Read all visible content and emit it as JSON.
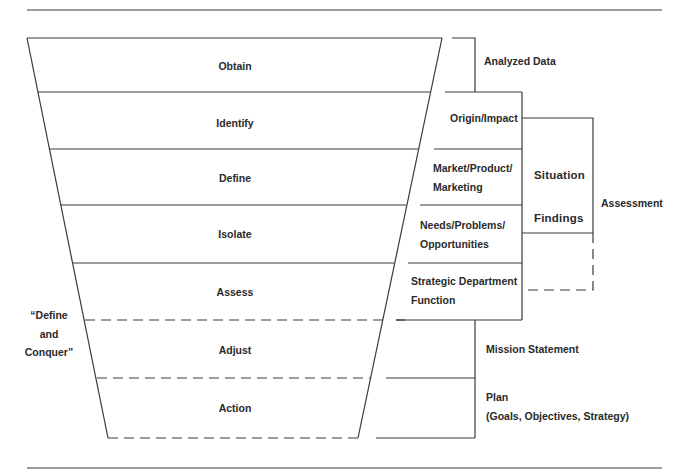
{
  "funnel": {
    "stages": [
      {
        "label": "Obtain"
      },
      {
        "label": "Identify"
      },
      {
        "label": "Define"
      },
      {
        "label": "Isolate"
      },
      {
        "label": "Assess"
      },
      {
        "label": "Adjust"
      },
      {
        "label": "Action"
      }
    ],
    "side_label": {
      "lines": [
        "“Define",
        "and",
        "Conquer”"
      ]
    }
  },
  "right_column": {
    "analyzed_data": "Analyzed Data",
    "boxes": [
      {
        "lines": [
          "Origin/Impact"
        ]
      },
      {
        "lines": [
          "Market/Product/",
          "Marketing"
        ]
      },
      {
        "lines": [
          "Needs/Problems/",
          "Opportunities"
        ]
      },
      {
        "lines": [
          "Strategic Department",
          "Function"
        ]
      }
    ],
    "situation_findings": [
      "Situation",
      "Findings"
    ],
    "assessment": "Assessment",
    "mission_statement": "Mission Statement",
    "plan": {
      "lines": [
        "Plan",
        "(Goals, Objectives, Strategy)"
      ]
    }
  },
  "colors": {
    "line": "#3a3a3a",
    "text": "#2a2a2a",
    "background": "#ffffff"
  }
}
